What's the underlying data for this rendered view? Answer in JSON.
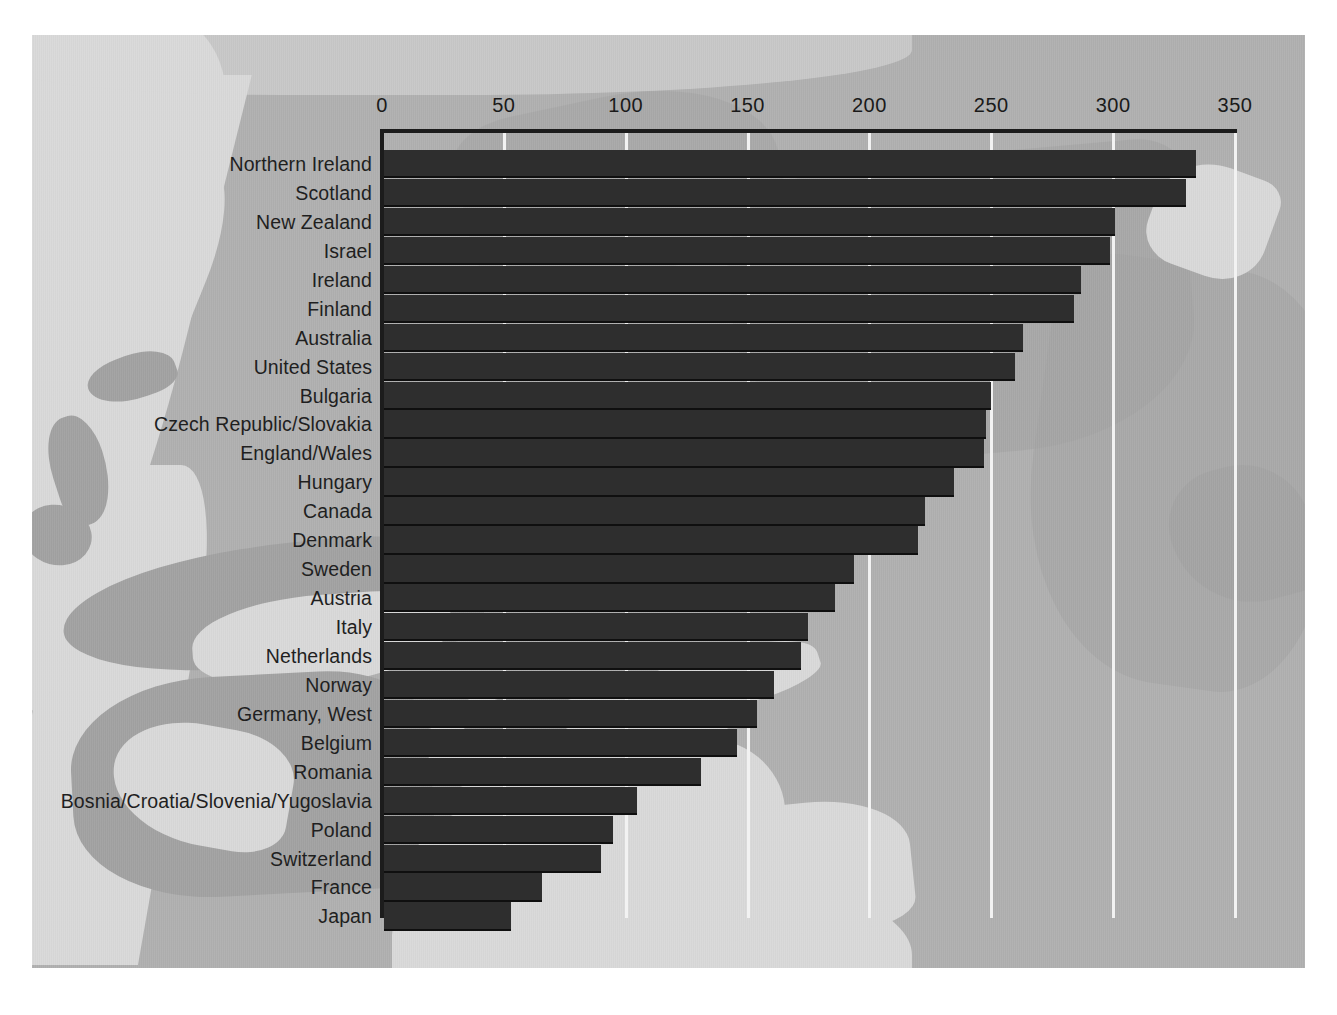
{
  "chart_data": {
    "type": "bar",
    "orientation": "horizontal",
    "title": "",
    "subtitle": "",
    "xlabel": "",
    "ylabel": "",
    "xlim": [
      0,
      350
    ],
    "xticks": [
      0,
      50,
      100,
      150,
      200,
      250,
      300,
      350
    ],
    "tick_labels": [
      "0",
      "50",
      "100",
      "150",
      "200",
      "250",
      "300",
      "350"
    ],
    "grid": "vertical-white-lines",
    "legend": "none",
    "axis_position": "top",
    "categories": [
      "Northern Ireland",
      "Scotland",
      "New Zealand",
      "Israel",
      "Ireland",
      "Finland",
      "Australia",
      "United States",
      "Bulgaria",
      "Czech Republic/Slovakia",
      "England/Wales",
      "Hungary",
      "Canada",
      "Denmark",
      "Sweden",
      "Austria",
      "Italy",
      "Netherlands",
      "Norway",
      "Germany, West",
      "Belgium",
      "Romania",
      "Bosnia/Croatia/Slovenia/Yugoslavia",
      "Poland",
      "Switzerland",
      "France",
      "Japan"
    ],
    "values": [
      333,
      329,
      300,
      298,
      286,
      283,
      262,
      259,
      249,
      247,
      246,
      234,
      222,
      219,
      193,
      185,
      174,
      171,
      160,
      153,
      145,
      130,
      104,
      94,
      89,
      65,
      52
    ],
    "colors": {
      "bar": "#2e2e2e",
      "bar_edge": "#0f0f0f",
      "axis": "#1c1c1c",
      "gridline": "#f2f2f2",
      "panel_background": "#b0b0b0",
      "page_background": "#ffffff",
      "label_text": "#1f1f1f"
    }
  }
}
